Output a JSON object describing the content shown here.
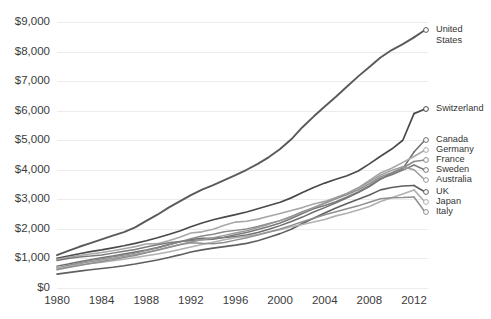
{
  "chart_data": {
    "type": "line",
    "title": "",
    "subtitle": "",
    "xlabel": "",
    "ylabel": "",
    "xlim": [
      1980,
      2012
    ],
    "ylim": [
      0,
      9000
    ],
    "grid": true,
    "legend_position": "right-endpoint-labels",
    "x_ticks": [
      "1980",
      "1984",
      "1988",
      "1992",
      "1996",
      "2000",
      "2004",
      "2008",
      "2012"
    ],
    "x_tick_values": [
      1980,
      1984,
      1988,
      1992,
      1996,
      2000,
      2004,
      2008,
      2012
    ],
    "y_ticks": [
      "$0",
      "$1,000",
      "$2,000",
      "$3,000",
      "$4,000",
      "$5,000",
      "$6,000",
      "$7,000",
      "$8,000",
      "$9,000"
    ],
    "y_tick_values": [
      0,
      1000,
      2000,
      3000,
      4000,
      5000,
      6000,
      7000,
      8000,
      9000
    ],
    "x": [
      1980,
      1981,
      1982,
      1983,
      1984,
      1985,
      1986,
      1987,
      1988,
      1989,
      1990,
      1991,
      1992,
      1993,
      1994,
      1995,
      1996,
      1997,
      1998,
      1999,
      2000,
      2001,
      2002,
      2003,
      2004,
      2005,
      2006,
      2007,
      2008,
      2009,
      2010,
      2011,
      2012
    ],
    "series": [
      {
        "name": "United States",
        "label": "United States",
        "color": "#5a5a5a",
        "width": 1.9,
        "label_dim": false,
        "values": [
          1110,
          1255,
          1395,
          1520,
          1645,
          1775,
          1890,
          2050,
          2270,
          2480,
          2720,
          2930,
          3140,
          3330,
          3480,
          3650,
          3820,
          4000,
          4200,
          4430,
          4700,
          5030,
          5440,
          5800,
          6140,
          6470,
          6820,
          7160,
          7480,
          7800,
          8050,
          8250,
          8480
        ]
      },
      {
        "name": "Switzerland",
        "label": "Switzerland",
        "color": "#4a4a4a",
        "width": 1.7,
        "label_dim": false,
        "values": [
          1000,
          1080,
          1160,
          1230,
          1290,
          1360,
          1430,
          1510,
          1600,
          1700,
          1810,
          1930,
          2070,
          2200,
          2310,
          2400,
          2480,
          2570,
          2680,
          2790,
          2900,
          3050,
          3230,
          3400,
          3550,
          3680,
          3800,
          3960,
          4200,
          4460,
          4700,
          5000,
          5900
        ]
      },
      {
        "name": "Canada",
        "label": "Canada",
        "color": "#6e6e6e",
        "width": 1.5,
        "label_dim": false,
        "values": [
          740,
          810,
          890,
          960,
          1020,
          1080,
          1150,
          1220,
          1290,
          1370,
          1470,
          1560,
          1640,
          1680,
          1690,
          1710,
          1740,
          1790,
          1880,
          1990,
          2110,
          2250,
          2400,
          2570,
          2720,
          2880,
          3050,
          3230,
          3430,
          3680,
          3880,
          4040,
          4600
        ]
      },
      {
        "name": "Germany",
        "label": "Germany",
        "color": "#a8a8a8",
        "width": 1.6,
        "label_dim": true,
        "values": [
          970,
          1040,
          1100,
          1150,
          1200,
          1260,
          1330,
          1400,
          1490,
          1500,
          1600,
          1720,
          1860,
          1900,
          1990,
          2120,
          2230,
          2260,
          2330,
          2430,
          2520,
          2620,
          2720,
          2840,
          2930,
          3060,
          3200,
          3390,
          3640,
          3890,
          4050,
          4250,
          4450
        ]
      },
      {
        "name": "France",
        "label": "France",
        "color": "#8a8a8a",
        "width": 1.5,
        "label_dim": false,
        "values": [
          680,
          760,
          850,
          930,
          990,
          1060,
          1120,
          1180,
          1270,
          1350,
          1450,
          1560,
          1670,
          1760,
          1820,
          1900,
          1950,
          2000,
          2080,
          2180,
          2280,
          2420,
          2580,
          2720,
          2870,
          3020,
          3160,
          3320,
          3530,
          3760,
          3900,
          4060,
          4280
        ]
      },
      {
        "name": "Sweden",
        "label": "Sweden",
        "color": "#7a7a7a",
        "width": 1.5,
        "label_dim": false,
        "values": [
          930,
          1000,
          1050,
          1080,
          1120,
          1180,
          1240,
          1300,
          1390,
          1460,
          1530,
          1570,
          1600,
          1630,
          1650,
          1720,
          1800,
          1880,
          1980,
          2080,
          2200,
          2350,
          2520,
          2680,
          2790,
          2920,
          3080,
          3250,
          3460,
          3700,
          3830,
          3990,
          4160
        ]
      },
      {
        "name": "Australia",
        "label": "Australia",
        "color": "#9a9a9a",
        "width": 1.5,
        "label_dim": false,
        "values": [
          660,
          730,
          820,
          890,
          950,
          1010,
          1070,
          1130,
          1200,
          1290,
          1380,
          1470,
          1560,
          1630,
          1700,
          1780,
          1860,
          1940,
          2050,
          2160,
          2280,
          2410,
          2560,
          2720,
          2880,
          3040,
          3200,
          3380,
          3600,
          3820,
          3980,
          4100,
          4000
        ]
      },
      {
        "name": "UK",
        "label": "UK",
        "color": "#5f5f5f",
        "width": 1.6,
        "label_dim": false,
        "values": [
          470,
          520,
          570,
          620,
          660,
          700,
          750,
          810,
          880,
          950,
          1030,
          1120,
          1220,
          1290,
          1350,
          1400,
          1450,
          1510,
          1600,
          1720,
          1840,
          1990,
          2180,
          2360,
          2540,
          2710,
          2860,
          3000,
          3150,
          3320,
          3400,
          3450,
          3470
        ]
      },
      {
        "name": "Japan",
        "label": "Japan",
        "color": "#b0b0b0",
        "width": 1.6,
        "label_dim": true,
        "values": [
          660,
          720,
          780,
          830,
          870,
          920,
          970,
          1030,
          1090,
          1150,
          1220,
          1300,
          1390,
          1470,
          1550,
          1630,
          1700,
          1750,
          1810,
          1900,
          1970,
          2070,
          2150,
          2230,
          2320,
          2440,
          2530,
          2640,
          2760,
          2930,
          3050,
          3180,
          3320
        ]
      },
      {
        "name": "Italy",
        "label": "Italy",
        "color": "#8f8f8f",
        "width": 1.5,
        "label_dim": false,
        "values": [
          620,
          690,
          760,
          830,
          900,
          960,
          1030,
          1100,
          1190,
          1280,
          1370,
          1460,
          1530,
          1510,
          1500,
          1540,
          1620,
          1700,
          1790,
          1890,
          2000,
          2120,
          2240,
          2360,
          2480,
          2580,
          2680,
          2780,
          2900,
          3020,
          3050,
          3060,
          3080
        ]
      }
    ],
    "endpoint_labels": [
      {
        "label": "United States",
        "line2": "",
        "dim": false
      },
      {
        "label": "Switzerland",
        "line2": "",
        "dim": false
      },
      {
        "label": "Canada",
        "line2": "",
        "dim": false
      },
      {
        "label": "Germany",
        "line2": "",
        "dim": true
      },
      {
        "label": "France",
        "line2": "",
        "dim": false
      },
      {
        "label": "Sweden",
        "line2": "",
        "dim": false
      },
      {
        "label": "Australia",
        "line2": "",
        "dim": false
      },
      {
        "label": "UK",
        "line2": "",
        "dim": false
      },
      {
        "label": "Japan",
        "line2": "",
        "dim": true
      },
      {
        "label": "Italy",
        "line2": "",
        "dim": false
      }
    ],
    "label_layout": [
      {
        "name": "United States",
        "lines": [
          "United",
          "States"
        ],
        "y": 30,
        "dim": false
      },
      {
        "name": "Switzerland",
        "lines": [
          "Switzerland"
        ],
        "y": 109,
        "dim": false
      },
      {
        "name": "Canada",
        "lines": [
          "Canada"
        ],
        "y": 140,
        "dim": false
      },
      {
        "name": "Germany",
        "lines": [
          "Germany"
        ],
        "y": 150,
        "dim": true
      },
      {
        "name": "France",
        "lines": [
          "France"
        ],
        "y": 160,
        "dim": false
      },
      {
        "name": "Sweden",
        "lines": [
          "Sweden"
        ],
        "y": 170,
        "dim": false
      },
      {
        "name": "Australia",
        "lines": [
          "Australia"
        ],
        "y": 180,
        "dim": false
      },
      {
        "name": "UK",
        "lines": [
          "UK"
        ],
        "y": 192,
        "dim": false
      },
      {
        "name": "Japan",
        "lines": [
          "Japan"
        ],
        "y": 202,
        "dim": true
      },
      {
        "name": "Italy",
        "lines": [
          "Italy"
        ],
        "y": 212,
        "dim": false
      }
    ],
    "colors": {
      "gridline": "#ececec",
      "tick_text": "#3b3b3b",
      "label_text": "#333333",
      "label_text_dim": "#b3b3b3",
      "background": "#ffffff"
    }
  }
}
